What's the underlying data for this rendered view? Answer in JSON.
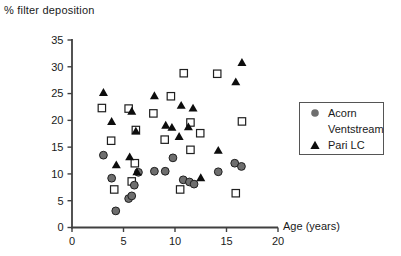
{
  "chart_data": {
    "type": "scatter",
    "title": "",
    "ylabel": "% filter deposition",
    "xlabel": "Age (years)",
    "xlim": [
      0,
      20
    ],
    "ylim": [
      0,
      35
    ],
    "xticks": [
      0,
      5,
      10,
      15,
      20
    ],
    "yticks": [
      0,
      5,
      10,
      15,
      20,
      25,
      30,
      35
    ],
    "grid": false,
    "legend_position": "center-right",
    "series": [
      {
        "name": "Acorn",
        "marker": "circle",
        "fill": "#6e6e6e",
        "stroke": "#1f1f1f",
        "points": [
          [
            3.05,
            13.5
          ],
          [
            3.85,
            9.2
          ],
          [
            4.25,
            3.1
          ],
          [
            5.5,
            5.4
          ],
          [
            5.8,
            5.9
          ],
          [
            6.05,
            7.9
          ],
          [
            6.45,
            10.3
          ],
          [
            8.0,
            10.5
          ],
          [
            9.05,
            10.5
          ],
          [
            9.8,
            13.0
          ],
          [
            10.8,
            8.9
          ],
          [
            11.4,
            8.5
          ],
          [
            11.85,
            8.1
          ],
          [
            14.2,
            10.4
          ],
          [
            15.8,
            12.0
          ],
          [
            16.45,
            11.4
          ]
        ]
      },
      {
        "name": "Ventstream",
        "marker": "square",
        "fill": "#ffffff",
        "stroke": "#1f1f1f",
        "points": [
          [
            2.9,
            22.3
          ],
          [
            3.8,
            16.2
          ],
          [
            4.1,
            7.1
          ],
          [
            5.5,
            22.2
          ],
          [
            5.8,
            8.6
          ],
          [
            6.1,
            12.0
          ],
          [
            6.2,
            18.2
          ],
          [
            7.9,
            21.3
          ],
          [
            9.0,
            16.4
          ],
          [
            9.6,
            24.5
          ],
          [
            10.5,
            7.1
          ],
          [
            10.85,
            28.8
          ],
          [
            11.5,
            19.6
          ],
          [
            11.5,
            14.5
          ],
          [
            12.45,
            17.6
          ],
          [
            14.1,
            28.7
          ],
          [
            15.9,
            6.4
          ],
          [
            16.5,
            19.8
          ]
        ]
      },
      {
        "name": "Pari LC",
        "marker": "triangle",
        "fill": "#0d0d0d",
        "stroke": "#0d0d0d",
        "points": [
          [
            3.05,
            25.2
          ],
          [
            3.85,
            19.8
          ],
          [
            4.3,
            11.7
          ],
          [
            5.6,
            13.2
          ],
          [
            5.8,
            21.7
          ],
          [
            6.2,
            18.0
          ],
          [
            6.3,
            10.4
          ],
          [
            8.0,
            24.6
          ],
          [
            9.1,
            19.1
          ],
          [
            9.7,
            18.7
          ],
          [
            10.4,
            17.0
          ],
          [
            10.6,
            22.8
          ],
          [
            11.3,
            18.8
          ],
          [
            11.75,
            22.3
          ],
          [
            12.5,
            9.3
          ],
          [
            14.2,
            14.4
          ],
          [
            15.9,
            27.2
          ],
          [
            16.5,
            30.8
          ]
        ]
      }
    ]
  },
  "colors": {
    "axis": "#404040",
    "text": "#1a1a1a",
    "legend_border": "#555555",
    "background": "#ffffff"
  }
}
